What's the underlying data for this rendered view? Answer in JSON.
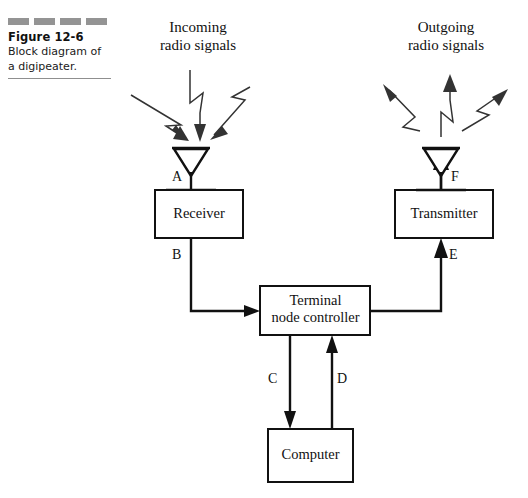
{
  "figure": {
    "number": "Figure 12-6",
    "caption": "Block diagram of a digipeater.",
    "dash_count": 4,
    "dash_color": "#949494",
    "rule_color": "#8f8f8f"
  },
  "headings": {
    "incoming": "Incoming\nradio signals",
    "incoming_line1": "Incoming",
    "incoming_line2": "radio signals",
    "outgoing_line1": "Outgoing",
    "outgoing_line2": "radio signals"
  },
  "blocks": [
    {
      "id": "receiver",
      "label": "Receiver"
    },
    {
      "id": "terminal-node-controller",
      "label_line1": "Terminal",
      "label_line2": "node controller"
    },
    {
      "id": "transmitter",
      "label": "Transmitter"
    },
    {
      "id": "computer",
      "label": "Computer"
    }
  ],
  "antennas": [
    {
      "id": "receive-antenna",
      "point_label": "A",
      "bolt_count": 3,
      "direction": "incoming"
    },
    {
      "id": "transmit-antenna",
      "point_label": "F",
      "bolt_count": 3,
      "direction": "outgoing"
    }
  ],
  "points": [
    {
      "label": "A",
      "description": "antenna to receiver"
    },
    {
      "label": "B",
      "description": "receiver to terminal node controller"
    },
    {
      "label": "C",
      "description": "terminal node controller to computer"
    },
    {
      "label": "D",
      "description": "computer to terminal node controller"
    },
    {
      "label": "E",
      "description": "terminal node controller to transmitter"
    },
    {
      "label": "F",
      "description": "transmitter to antenna"
    }
  ],
  "colors": {
    "line": "#111111",
    "bolt": "#333333",
    "background": "#ffffff"
  }
}
